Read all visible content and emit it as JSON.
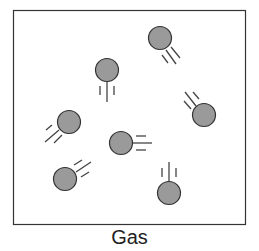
{
  "caption": "Gas",
  "colors": {
    "particle_fill": "#9a9a9a",
    "stroke": "#333333",
    "background": "#ffffff"
  },
  "particles": [
    {
      "cx": 160,
      "cy": 38,
      "motion": "up-left"
    },
    {
      "cx": 107,
      "cy": 70,
      "motion": "up"
    },
    {
      "cx": 69,
      "cy": 122,
      "motion": "up-right"
    },
    {
      "cx": 121,
      "cy": 143,
      "motion": "left"
    },
    {
      "cx": 204,
      "cy": 115,
      "motion": "down-right"
    },
    {
      "cx": 65,
      "cy": 179,
      "motion": "down-left"
    },
    {
      "cx": 169,
      "cy": 193,
      "motion": "down"
    }
  ]
}
